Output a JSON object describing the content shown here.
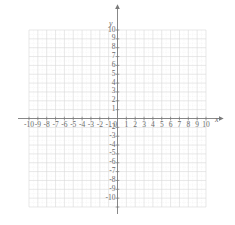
{
  "figure": {
    "kind": "cartesian-coordinate-grid",
    "background_color": "#ffffff",
    "axis_color": "#7a7a7a",
    "major_grid_color": "#d9d9d9",
    "minor_grid_color": "#ebebeb",
    "label_color": "#6b6b6b"
  },
  "axes": {
    "x": {
      "name": "x",
      "min": -10,
      "max": 10,
      "step": 1,
      "minor_divisions": 2,
      "arrow": "right",
      "tick_labels": [
        "-10",
        "-9",
        "-8",
        "-7",
        "-6",
        "-5",
        "-4",
        "-3",
        "-2",
        "-1",
        "1",
        "2",
        "3",
        "4",
        "5",
        "6",
        "7",
        "8",
        "9",
        "10"
      ]
    },
    "y": {
      "name": "y",
      "min": -10,
      "max": 10,
      "step": 1,
      "minor_divisions": 2,
      "arrow": "up",
      "tick_labels": [
        "10",
        "9",
        "8",
        "7",
        "6",
        "5",
        "4",
        "3",
        "2",
        "1",
        "-2",
        "-3",
        "-4",
        "-5",
        "-6",
        "-7",
        "-8",
        "-9",
        "-10"
      ]
    }
  },
  "origin": {
    "label": "0",
    "x": 0,
    "y": 0
  },
  "chart_data": {
    "type": "scatter",
    "title": "",
    "xlabel": "x",
    "ylabel": "y",
    "xlim": [
      -10,
      10
    ],
    "ylim": [
      -10,
      10
    ],
    "xticks": [
      -10,
      -9,
      -8,
      -7,
      -6,
      -5,
      -4,
      -3,
      -2,
      -1,
      0,
      1,
      2,
      3,
      4,
      5,
      6,
      7,
      8,
      9,
      10
    ],
    "yticks": [
      -10,
      -9,
      -8,
      -7,
      -6,
      -5,
      -4,
      -3,
      -2,
      -1,
      0,
      1,
      2,
      3,
      4,
      5,
      6,
      7,
      8,
      9,
      10
    ],
    "grid": true,
    "legend": null,
    "series": [],
    "annotations": []
  }
}
